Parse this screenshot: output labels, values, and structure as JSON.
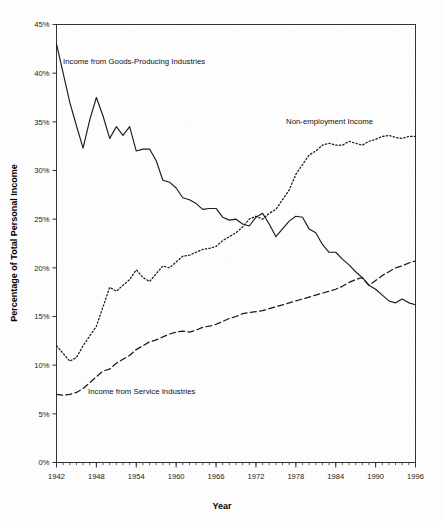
{
  "axes": {
    "y_title": "Percentage of Total Personal Income",
    "x_title": "Year",
    "y_ticks": [
      "0%",
      "5%",
      "10%",
      "15%",
      "20%",
      "25%",
      "30%",
      "35%",
      "40%",
      "45%"
    ],
    "x_ticks": [
      "1942",
      "1948",
      "1954",
      "1960",
      "1966",
      "1972",
      "1978",
      "1984",
      "1990",
      "1996"
    ]
  },
  "annotations": {
    "goods": "Income from Goods-Producing Industries",
    "nonemp": "Non-employment Income",
    "service": "Income from Service Industries"
  },
  "colors": {
    "line": "#1a1a1a",
    "axis": "#333333",
    "background": "#fdfdfd"
  },
  "chart_data": {
    "type": "line",
    "title": "",
    "xlabel": "Year",
    "ylabel": "Percentage of Total Personal Income",
    "xlim": [
      1942,
      1996
    ],
    "ylim": [
      0,
      45
    ],
    "y_tick_step": 5,
    "x_tick_step": 6,
    "x_minor_tick_step": 1,
    "grid": false,
    "legend": "inline-annotations",
    "x": [
      1942,
      1943,
      1944,
      1945,
      1946,
      1947,
      1948,
      1949,
      1950,
      1951,
      1952,
      1953,
      1954,
      1955,
      1956,
      1957,
      1958,
      1959,
      1960,
      1961,
      1962,
      1963,
      1964,
      1965,
      1966,
      1967,
      1968,
      1969,
      1970,
      1971,
      1972,
      1973,
      1974,
      1975,
      1976,
      1977,
      1978,
      1979,
      1980,
      1981,
      1982,
      1983,
      1984,
      1985,
      1986,
      1987,
      1988,
      1989,
      1990,
      1991,
      1992,
      1993,
      1994,
      1995,
      1996
    ],
    "series": [
      {
        "name": "Income from Goods-Producing Industries",
        "style": "solid",
        "values": [
          43.0,
          40.0,
          37.0,
          34.6,
          32.3,
          35.2,
          37.5,
          35.6,
          33.3,
          34.5,
          33.6,
          34.5,
          32.0,
          32.2,
          32.2,
          31.0,
          29.0,
          28.8,
          28.2,
          27.2,
          27.0,
          26.6,
          26.0,
          26.1,
          26.1,
          25.2,
          24.9,
          25.0,
          24.5,
          24.3,
          25.2,
          25.6,
          24.5,
          23.2,
          24.0,
          24.8,
          25.3,
          25.2,
          24.0,
          23.6,
          22.4,
          21.6,
          21.6,
          20.9,
          20.3,
          19.6,
          19.0,
          18.2,
          17.8,
          17.2,
          16.6,
          16.4,
          16.8,
          16.4,
          16.2
        ]
      },
      {
        "name": "Non-employment Income",
        "style": "dotted",
        "values": [
          12.0,
          11.2,
          10.4,
          10.8,
          12.0,
          13.0,
          14.0,
          16.0,
          18.0,
          17.6,
          18.2,
          18.8,
          19.8,
          19.0,
          18.6,
          19.4,
          20.2,
          20.0,
          20.6,
          21.2,
          21.3,
          21.6,
          21.9,
          22.0,
          22.2,
          22.8,
          23.2,
          23.6,
          24.2,
          25.0,
          25.3,
          25.0,
          25.6,
          26.0,
          27.0,
          28.0,
          29.6,
          30.6,
          31.6,
          32.0,
          32.6,
          32.8,
          32.6,
          32.6,
          33.0,
          32.8,
          32.6,
          33.0,
          33.2,
          33.5,
          33.6,
          33.4,
          33.3,
          33.5,
          33.5
        ]
      },
      {
        "name": "Income from Service Industries",
        "style": "dashed",
        "values": [
          7.0,
          6.9,
          7.0,
          7.2,
          7.6,
          8.2,
          8.8,
          9.4,
          9.6,
          10.2,
          10.6,
          11.0,
          11.6,
          12.0,
          12.4,
          12.6,
          12.9,
          13.2,
          13.4,
          13.5,
          13.4,
          13.6,
          13.9,
          14.0,
          14.2,
          14.5,
          14.8,
          15.0,
          15.3,
          15.4,
          15.5,
          15.6,
          15.8,
          16.0,
          16.2,
          16.4,
          16.6,
          16.8,
          17.0,
          17.2,
          17.4,
          17.6,
          17.8,
          18.1,
          18.5,
          18.8,
          19.0,
          18.2,
          18.7,
          19.2,
          19.6,
          20.0,
          20.2,
          20.5,
          20.7
        ]
      }
    ],
    "crossings": [
      {
        "series": [
          "Income from Goods-Producing Industries",
          "Non-employment Income"
        ],
        "year": 1969,
        "value": 25.0
      },
      {
        "series": [
          "Income from Goods-Producing Industries",
          "Income from Service Industries"
        ],
        "year": 1989,
        "value": 18.2
      }
    ]
  }
}
